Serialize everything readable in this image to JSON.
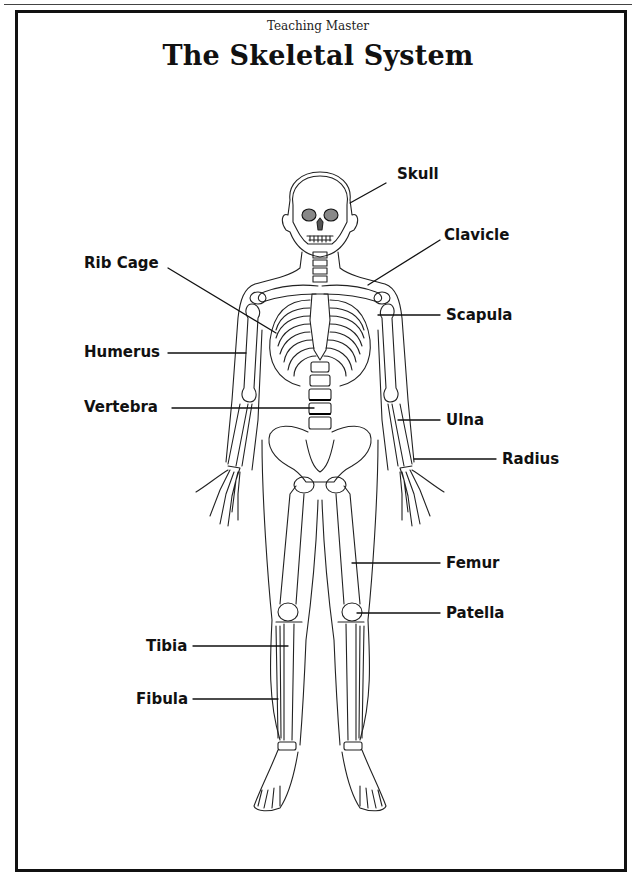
{
  "header": {
    "subtitle": "Teaching Master",
    "title": "The Skeletal System"
  },
  "labels": {
    "skull": "Skull",
    "clavicle": "Clavicle",
    "rib_cage": "Rib Cage",
    "scapula": "Scapula",
    "humerus": "Humerus",
    "vertebra": "Vertebra",
    "ulna": "Ulna",
    "radius": "Radius",
    "femur": "Femur",
    "patella": "Patella",
    "tibia": "Tibia",
    "fibula": "Fibula"
  },
  "colors": {
    "ink": "#111111",
    "paper": "#ffffff"
  }
}
